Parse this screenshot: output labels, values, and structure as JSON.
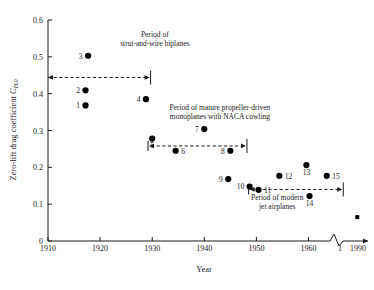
{
  "chart_data": {
    "type": "scatter",
    "title": "",
    "xlabel": "Year",
    "ylabel": "Zero-lift drag coefficient C_D,0",
    "ylabel_parts": {
      "main": "Zero-lift drag coefficient ",
      "symbol": "C",
      "subscript": "D,0"
    },
    "xlim": [
      1910,
      1990
    ],
    "ylim": [
      0,
      0.6
    ],
    "grid": false,
    "legend": "none",
    "axis_break": {
      "present": true,
      "between": [
        1965,
        1985
      ],
      "label_after_break": "1990"
    },
    "xticks": [
      1910,
      1920,
      1930,
      1940,
      1950,
      1960,
      1990
    ],
    "xtick_labels": [
      "1910",
      "1920",
      "1930",
      "1940",
      "1950",
      "1960",
      "1990"
    ],
    "yticks": [
      0,
      0.1,
      0.2,
      0.3,
      0.4,
      0.5,
      0.6
    ],
    "ytick_labels": [
      "0",
      "0.1",
      "0.2",
      "0.3",
      "0.4",
      "0.5",
      "0.6"
    ],
    "points": [
      {
        "label": "1",
        "x": 1917.2,
        "y": 0.368,
        "label_side": "left",
        "marker": "dot"
      },
      {
        "label": "2",
        "x": 1917.2,
        "y": 0.409,
        "label_side": "left",
        "marker": "dot"
      },
      {
        "label": "3",
        "x": 1917.7,
        "y": 0.503,
        "label_side": "left",
        "marker": "dot"
      },
      {
        "label": "4",
        "x": 1928.8,
        "y": 0.385,
        "label_side": "left",
        "marker": "dot"
      },
      {
        "label": "5",
        "x": 1930.0,
        "y": 0.278,
        "label_side": "below",
        "marker": "dot"
      },
      {
        "label": "6",
        "x": 1934.5,
        "y": 0.245,
        "label_side": "right",
        "marker": "dot"
      },
      {
        "label": "7",
        "x": 1940.0,
        "y": 0.304,
        "label_side": "left",
        "marker": "dot"
      },
      {
        "label": "8",
        "x": 1945.0,
        "y": 0.245,
        "label_side": "left",
        "marker": "dot"
      },
      {
        "label": "9",
        "x": 1944.6,
        "y": 0.168,
        "label_side": "left",
        "marker": "dot"
      },
      {
        "label": "10",
        "x": 1948.7,
        "y": 0.148,
        "label_side": "left",
        "marker": "dot"
      },
      {
        "label": "11",
        "x": 1950.4,
        "y": 0.139,
        "label_side": "right",
        "marker": "dot"
      },
      {
        "label": "12",
        "x": 1954.4,
        "y": 0.177,
        "label_side": "right",
        "marker": "dot"
      },
      {
        "label": "13",
        "x": 1959.6,
        "y": 0.206,
        "label_side": "below",
        "marker": "dot"
      },
      {
        "label": "14",
        "x": 1960.2,
        "y": 0.122,
        "label_side": "below",
        "marker": "dot"
      },
      {
        "label": "15",
        "x": 1963.5,
        "y": 0.177,
        "label_side": "right",
        "marker": "dot"
      },
      {
        "label": "",
        "x": 1989.0,
        "y": 0.065,
        "label_side": "none",
        "marker": "square"
      }
    ],
    "period_spans": [
      {
        "name": "strut-and-wire-biplanes",
        "text_lines": [
          "Period of",
          "strut-and-wire biplanes"
        ],
        "text_x": 1930.5,
        "text_y": 0.555,
        "line_y": 0.444,
        "x_start": 1910.0,
        "x_end": 1929.5,
        "cap_start": "none",
        "cap_end": "arrow_and_bar"
      },
      {
        "name": "mature-propeller-driven-monoplanes",
        "text_lines": [
          "Period of mature propeller-driven",
          "monoplanes with NACA cowling"
        ],
        "text_x": 1943.0,
        "text_y": 0.355,
        "line_y": 0.258,
        "x_start": 1929.2,
        "x_end": 1948.0,
        "cap_start": "bar_and_arrow",
        "cap_end": "arrow_and_bar"
      },
      {
        "name": "modern-jet-airplanes",
        "text_lines": [
          "Period of modern",
          "jet airplanes"
        ],
        "text_x": 1954.0,
        "text_y": 0.112,
        "line_y": 0.14,
        "x_start": 1948.5,
        "x_end": 1969.0,
        "cap_start": "bar_and_arrow",
        "cap_end": "arrow_and_bar"
      }
    ]
  },
  "colors": {
    "background": "#ffffff",
    "ink": "#1a1a1a",
    "marker": "#000000"
  }
}
